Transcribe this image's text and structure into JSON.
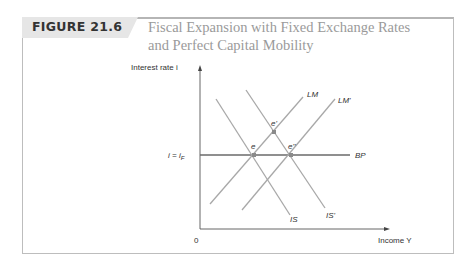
{
  "figure": {
    "label": "FIGURE 21.6",
    "title_line1": "Fiscal Expansion with Fixed Exchange Rates",
    "title_line2": "and Perfect Capital Mobility"
  },
  "diagram": {
    "y_axis_label": "Interest rate i",
    "x_axis_label": "Income Y",
    "origin_label": "0",
    "bp_level_label": "i = iF",
    "curves": [
      "LM",
      "LM'",
      "IS",
      "IS'",
      "BP"
    ],
    "points": [
      "e",
      "e'",
      "e''"
    ]
  },
  "colors": {
    "curve": "#a8a8a8",
    "bp": "#6a6a6a",
    "axis": "#555555",
    "point": "#8a8a8a",
    "title": "#9a9a9a",
    "tag_bg": "#e6e6e6"
  }
}
